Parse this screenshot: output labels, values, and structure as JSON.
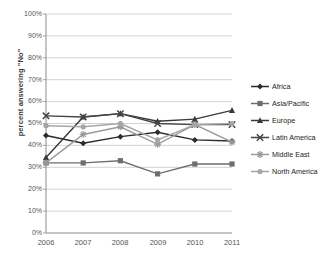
{
  "chart_data": {
    "type": "line",
    "title": "",
    "xlabel": "",
    "ylabel": "percent answering \"No\"",
    "categories": [
      "2006",
      "2007",
      "2008",
      "2009",
      "2010",
      "2011"
    ],
    "x": [
      2006,
      2007,
      2008,
      2009,
      2010,
      2011
    ],
    "ylim": [
      0,
      100
    ],
    "ytick_labels": [
      "100%",
      "90%",
      "80%",
      "70%",
      "60%",
      "50%",
      "40%",
      "30%",
      "20%",
      "10%",
      "0%"
    ],
    "ytick_values": [
      100,
      90,
      80,
      70,
      60,
      50,
      40,
      30,
      20,
      10,
      0
    ],
    "grid": "horizontal",
    "legend_position": "right",
    "series": [
      {
        "name": "Africa",
        "marker": "diamond",
        "color": "#2b2b2b",
        "values": [
          44.5,
          41.0,
          44.0,
          46.0,
          42.5,
          42.0
        ]
      },
      {
        "name": "Asia/Pacific",
        "marker": "square",
        "color": "#6e6e6e",
        "values": [
          32.0,
          32.0,
          33.0,
          27.0,
          31.5,
          31.5
        ]
      },
      {
        "name": "Europe",
        "marker": "triangle",
        "color": "#3a3a3a",
        "values": [
          34.5,
          53.0,
          54.5,
          51.0,
          52.0,
          56.0
        ]
      },
      {
        "name": "Latin America",
        "marker": "x",
        "color": "#454545",
        "values": [
          53.5,
          53.0,
          54.5,
          50.0,
          49.5,
          49.5
        ]
      },
      {
        "name": "Middle East",
        "marker": "asterisk",
        "color": "#9a9a9a",
        "values": [
          32.0,
          45.0,
          48.5,
          40.5,
          49.5,
          41.5
        ]
      },
      {
        "name": "North America",
        "marker": "circle",
        "color": "#a5a5a5",
        "values": [
          49.0,
          48.5,
          50.0,
          42.5,
          49.5,
          50.0
        ]
      }
    ]
  }
}
